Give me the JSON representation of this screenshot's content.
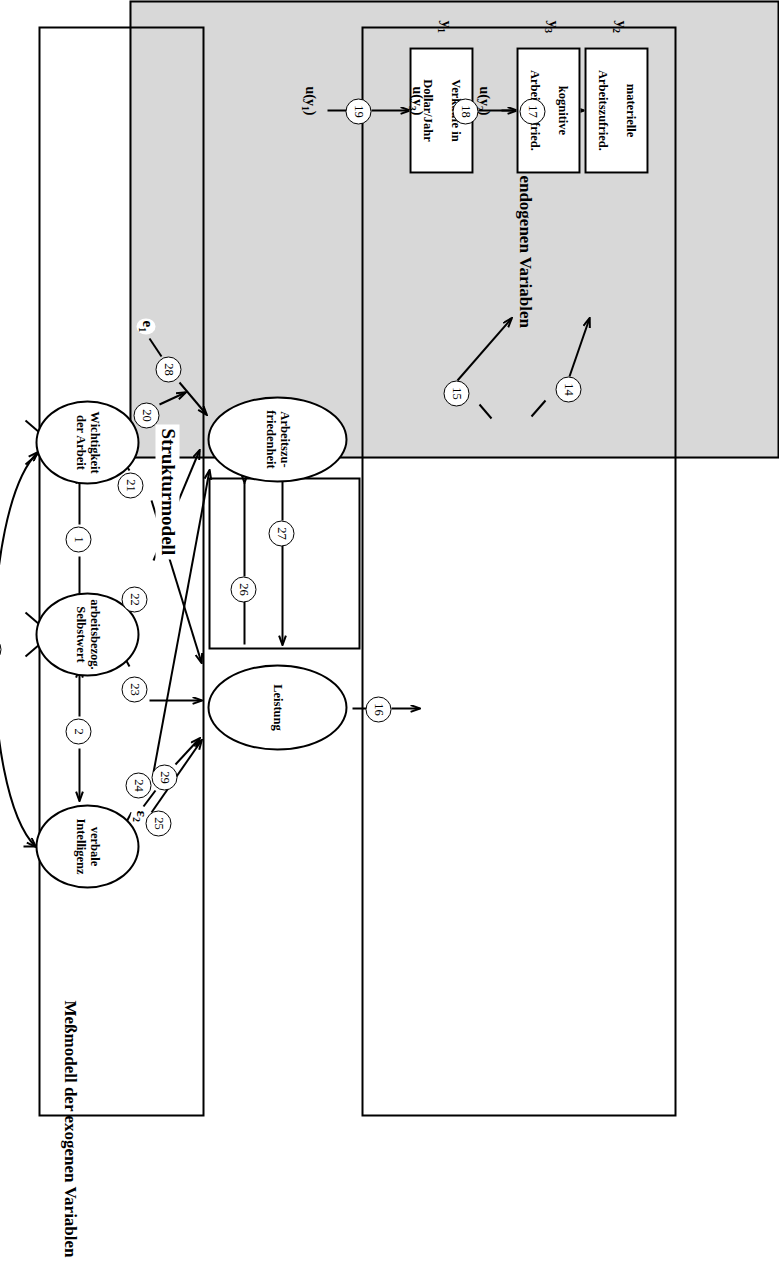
{
  "figure": {
    "orientation_degrees": 90,
    "panels": {
      "endogenous_measurement": "Meßmodell der endogenen Variablen",
      "structural": "Strukturmodell",
      "exogenous_measurement": "Meßmodell der exogenen Variablen"
    }
  },
  "indicators_y": [
    {
      "tag": "y",
      "sub": "2",
      "label_line1": "materielle",
      "label_line2": "Arbeitszufried.",
      "disturbance": "u(y",
      "disturbance_sub": "2",
      "disturbance_close": ")",
      "path": "17",
      "loading_path": "14"
    },
    {
      "tag": "y",
      "sub": "3",
      "label_line1": "kognitive",
      "label_line2": "Arbeitszufried.",
      "disturbance": "u(y",
      "disturbance_sub": "3",
      "disturbance_close": ")",
      "path": "18",
      "loading_path": "15"
    },
    {
      "tag": "y",
      "sub": "1",
      "label_line1": "Verkäufe in",
      "label_line2": "Dollar/Jahr",
      "disturbance": "u(y",
      "disturbance_sub": "1",
      "disturbance_close": ")",
      "path": "19",
      "loading_path": "16"
    }
  ],
  "indicators_x": [
    {
      "tag": "x",
      "sub": "1",
      "label_line1": "absoluter Wich-",
      "label_line2": "tigkeits-Index",
      "disturbance": "u(x",
      "disturbance_sub": "1",
      "disturbance_close": ")",
      "path": "9",
      "loading_path": "4"
    },
    {
      "tag": "x",
      "sub": "2",
      "label_line1": "relativer Wich-",
      "label_line2": "tigkeits-Index",
      "disturbance": "u(x",
      "disturbance_sub": "2",
      "disturbance_close": ")",
      "path": "10",
      "loading_path": "5"
    },
    {
      "tag": "x",
      "sub": "3",
      "label_line1": "Selbsteinstu-",
      "label_line2": "fungs-Index 1",
      "disturbance": "u(x",
      "disturbance_sub": "3",
      "disturbance_close": ")",
      "path": "11",
      "loading_path": "6"
    },
    {
      "tag": "x",
      "sub": "4",
      "label_line1": "Selbsteinstu-",
      "label_line2": "fungs-Index 2",
      "disturbance": "u(x",
      "disturbance_sub": "4",
      "disturbance_close": ")",
      "path": "12",
      "loading_path": "7"
    },
    {
      "tag": "x",
      "sub": "5",
      "label_line1": "Wortassoziati-",
      "label_line2": "ons-Index",
      "disturbance": "u(x",
      "disturbance_sub": "5",
      "disturbance_close": ")",
      "path": "13",
      "loading_path": "8"
    }
  ],
  "latent_endogenous": [
    {
      "name": "arbeitszufriedenheit",
      "line1": "Arbeitszu-",
      "line2": "friedenheit",
      "error": "e",
      "error_sub": "1",
      "error_path": "28"
    },
    {
      "name": "leistung",
      "line1": "Leistung",
      "line2": "",
      "error": "ε",
      "error_sub": "2",
      "error_path": "29"
    }
  ],
  "latent_exogenous": [
    {
      "name": "wichtigkeit-der-arbeit",
      "line1": "Wichtigkeit",
      "line2": "der Arbeit"
    },
    {
      "name": "arbeitsbezogener-selbstwert",
      "line1": "arbeitsbezog.",
      "line2": "Selbstwert"
    },
    {
      "name": "verbale-intelligenz",
      "line1": "verbale",
      "line2": "Intelligenz"
    }
  ],
  "correlation_paths": [
    {
      "id": "1",
      "from": "Wichtigkeit der Arbeit",
      "to": "arbeitsbezog. Selbstwert",
      "type": "double"
    },
    {
      "id": "2",
      "from": "arbeitsbezog. Selbstwert",
      "to": "verbale Intelligenz",
      "type": "double"
    },
    {
      "id": "3",
      "from": "Wichtigkeit der Arbeit",
      "to": "verbale Intelligenz",
      "type": "double-curved"
    }
  ],
  "structural_paths": [
    {
      "id": "20",
      "from": "Wichtigkeit der Arbeit",
      "to": "Arbeitszufriedenheit"
    },
    {
      "id": "21",
      "from": "Wichtigkeit der Arbeit",
      "to": "Leistung"
    },
    {
      "id": "22",
      "from": "arbeitsbezog. Selbstwert",
      "to": "Arbeitszufriedenheit"
    },
    {
      "id": "23",
      "from": "arbeitsbezog. Selbstwert",
      "to": "Leistung"
    },
    {
      "id": "24",
      "from": "verbale Intelligenz",
      "to": "Arbeitszufriedenheit"
    },
    {
      "id": "25",
      "from": "verbale Intelligenz",
      "to": "Leistung"
    },
    {
      "id": "26",
      "from": "Leistung",
      "to": "Arbeitszufriedenheit"
    },
    {
      "id": "27",
      "from": "Arbeitszufriedenheit",
      "to": "Leistung"
    }
  ],
  "colors": {
    "structural_fill": "#d8d8d8",
    "stroke": "#000000",
    "node_fill": "#ffffff"
  }
}
